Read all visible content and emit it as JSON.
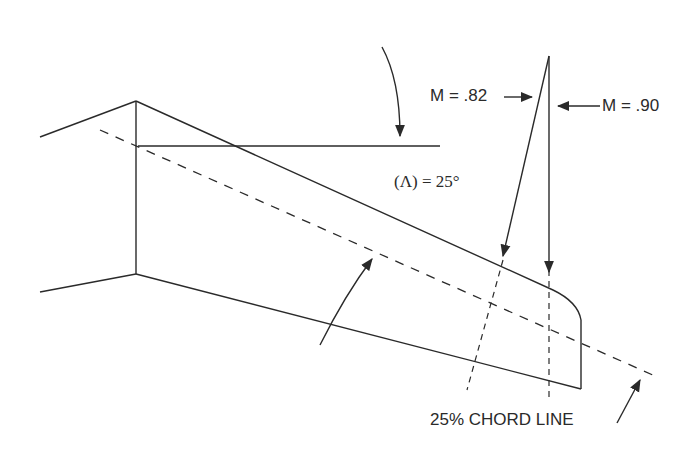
{
  "diagram": {
    "labels": {
      "mach_root": "M = .82",
      "mach_tip": "M = .90",
      "sweep_angle": "(Λ) = 25°",
      "chord_line": "25% CHORD LINE"
    },
    "colors": {
      "stroke": "#2a2a2a",
      "background": "#ffffff"
    },
    "sweep_angle_deg": 25
  }
}
